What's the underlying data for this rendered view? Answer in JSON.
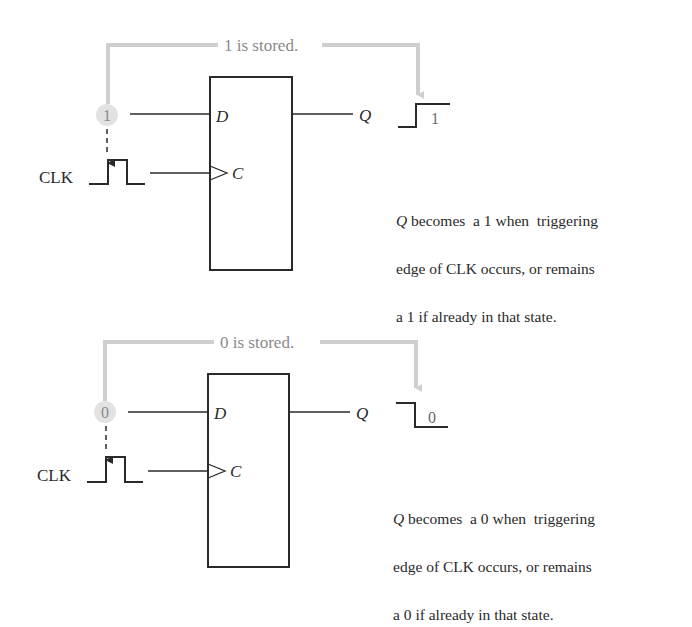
{
  "colors": {
    "ink": "#2a2a2a",
    "annotation_gray": "#cfcfcf",
    "annotation_text": "#8a8a8a",
    "input_bubble": "#e2e2e2"
  },
  "panels": [
    {
      "id": "store-one",
      "stored_label": "1 is stored.",
      "d_input_value": "1",
      "clk_label": "CLK",
      "pin_d": "D",
      "pin_c": "C",
      "output_label": "Q",
      "output_waveform": "rising",
      "output_value": "1",
      "description": {
        "q": "Q",
        "line1_rest": " becomes  a 1 when  triggering",
        "line2": "edge of CLK occurs, or remains",
        "line3": "a 1 if already in that state."
      }
    },
    {
      "id": "store-zero",
      "stored_label": "0 is stored.",
      "d_input_value": "0",
      "clk_label": "CLK",
      "pin_d": "D",
      "pin_c": "C",
      "output_label": "Q",
      "output_waveform": "falling",
      "output_value": "0",
      "description": {
        "q": "Q",
        "line1_rest": " becomes  a 0 when  triggering",
        "line2": "edge of CLK occurs, or remains",
        "line3": "a 0 if already in that state."
      }
    }
  ]
}
